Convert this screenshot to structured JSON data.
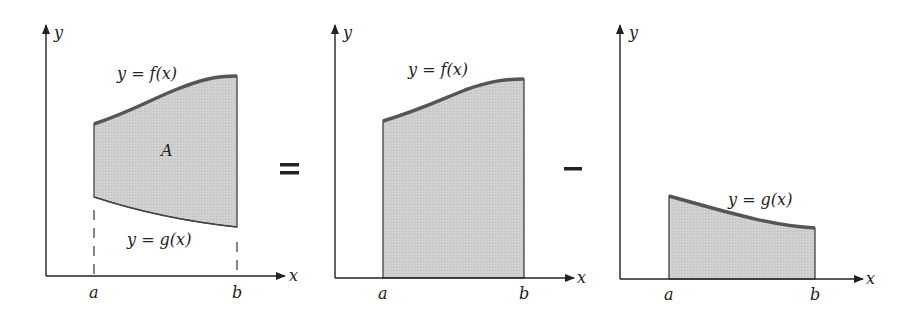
{
  "figure": {
    "colors": {
      "axis": "#222222",
      "curve": "#555555",
      "fill": "#cfcfcf",
      "background": "#ffffff"
    },
    "operators": {
      "equals": "=",
      "minus": "–"
    },
    "panels": [
      {
        "id": "combined",
        "axis_x_label": "x",
        "axis_y_label": "y",
        "tick_a": "a",
        "tick_b": "b",
        "upper_curve_label": "y = f(x)",
        "lower_curve_label": "y = g(x)",
        "region_label": "A"
      },
      {
        "id": "under-f",
        "axis_x_label": "x",
        "axis_y_label": "y",
        "tick_a": "a",
        "tick_b": "b",
        "curve_label": "y = f(x)"
      },
      {
        "id": "under-g",
        "axis_x_label": "x",
        "axis_y_label": "y",
        "tick_a": "a",
        "tick_b": "b",
        "curve_label": "y = g(x)"
      }
    ]
  }
}
